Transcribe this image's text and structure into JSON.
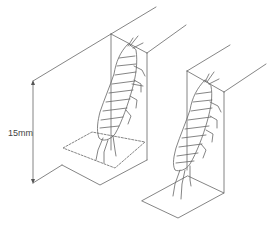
{
  "diagram": {
    "type": "technical illustration",
    "dimension_label": "15mm",
    "colors": {
      "line": "#555555",
      "background": "#ffffff"
    },
    "figures": [
      {
        "id": "left",
        "has_dashed_outline": true,
        "has_dimension": true
      },
      {
        "id": "right",
        "has_dashed_outline": false,
        "has_dimension": false
      }
    ]
  }
}
